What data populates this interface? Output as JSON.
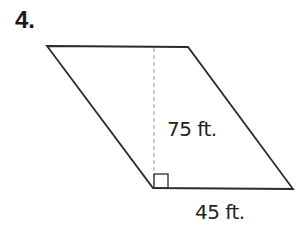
{
  "problem": {
    "number": "4."
  },
  "figure": {
    "shape": "parallelogram",
    "height_label": "75 ft.",
    "base_label": "45 ft.",
    "right_angle_marker": true,
    "colors": {
      "stroke": "#2a2a2a",
      "dashed": "#aaaaaa"
    }
  }
}
